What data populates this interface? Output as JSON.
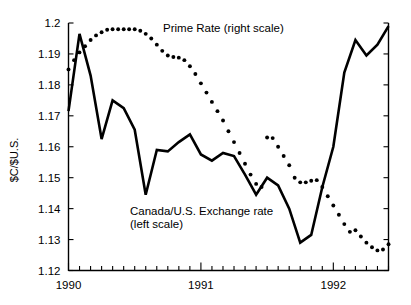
{
  "chart_data": {
    "type": "line",
    "title": "",
    "xlabel": "",
    "ylabel": "$C/$U.S.",
    "ylim": [
      1.12,
      1.2
    ],
    "yticks": [
      "1.12",
      "1.13",
      "1.14",
      "1.15",
      "1.16",
      "1.17",
      "1.18",
      "1.19",
      "1.2"
    ],
    "ytick_values": [
      1.12,
      1.13,
      1.14,
      1.15,
      1.16,
      1.17,
      1.18,
      1.19,
      1.2
    ],
    "xticks": [
      "1990",
      "1991",
      "1992"
    ],
    "xtick_values": [
      1990.0,
      1991.0,
      1992.0
    ],
    "xlim": [
      1990.0,
      1992.4167
    ],
    "x_minor_tick_interval_months": 1,
    "grid": false,
    "right_axis": {
      "label": "Prime Rate (right scale)",
      "ticks_shown": true,
      "tick_labels_shown": false,
      "n_ticks": 9
    },
    "legend_position": "inline-annotations",
    "annotations": [
      {
        "name": "prime-rate-annotation",
        "text": "Prime Rate (right scale)",
        "x_px": 163,
        "y_px": 32
      },
      {
        "name": "exchange-rate-annotation-line1",
        "text": "Canada/U.S. Exchange rate",
        "x_px": 130,
        "y_px": 215
      },
      {
        "name": "exchange-rate-annotation-line2",
        "text": "(left scale)",
        "x_px": 130,
        "y_px": 228
      }
    ],
    "series": [
      {
        "name": "Canada/U.S. Exchange rate (left scale)",
        "short_name": "exchange-rate",
        "style": "solid",
        "scale": "left",
        "color": "#000000",
        "x": [
          1990.0,
          1990.083,
          1990.167,
          1990.25,
          1990.333,
          1990.417,
          1990.5,
          1990.583,
          1990.667,
          1990.75,
          1990.833,
          1990.917,
          1991.0,
          1991.083,
          1991.167,
          1991.25,
          1991.333,
          1991.417,
          1991.5,
          1991.583,
          1991.667,
          1991.75,
          1991.833,
          1991.917,
          1992.0,
          1992.083,
          1992.167,
          1992.25,
          1992.333,
          1992.417
        ],
        "values": [
          1.1715,
          1.1965,
          1.183,
          1.1625,
          1.175,
          1.1725,
          1.1655,
          1.1445,
          1.159,
          1.1585,
          1.1615,
          1.164,
          1.1575,
          1.1555,
          1.158,
          1.157,
          1.151,
          1.1445,
          1.15,
          1.1475,
          1.14,
          1.129,
          1.1315,
          1.147,
          1.16,
          1.184,
          1.1945,
          1.1895,
          1.193,
          1.199
        ]
      },
      {
        "name": "Prime Rate (right scale)",
        "short_name": "prime-rate",
        "style": "dotted",
        "scale": "right",
        "color": "#000000",
        "x": [
          1990.0,
          1990.042,
          1990.083,
          1990.125,
          1990.167,
          1990.208,
          1990.25,
          1990.292,
          1990.333,
          1990.375,
          1990.417,
          1990.458,
          1990.5,
          1990.542,
          1990.583,
          1990.625,
          1990.667,
          1990.708,
          1990.75,
          1990.792,
          1990.833,
          1990.875,
          1990.917,
          1990.958,
          1991.0,
          1991.042,
          1991.083,
          1991.125,
          1991.167,
          1991.208,
          1991.25,
          1991.292,
          1991.333,
          1991.375,
          1991.417,
          1991.458,
          1991.5,
          1991.542,
          1991.583,
          1991.625,
          1991.667,
          1991.708,
          1991.75,
          1991.792,
          1991.833,
          1991.875,
          1991.917,
          1991.958,
          1992.0,
          1992.042,
          1992.083,
          1992.125,
          1992.167,
          1992.208,
          1992.25,
          1992.292,
          1992.333,
          1992.375,
          1992.417
        ],
        "values_equiv_left_axis": [
          1.185,
          1.188,
          1.1905,
          1.1925,
          1.1945,
          1.196,
          1.197,
          1.1978,
          1.198,
          1.198,
          1.198,
          1.198,
          1.198,
          1.1975,
          1.1965,
          1.195,
          1.193,
          1.191,
          1.1895,
          1.189,
          1.1888,
          1.188,
          1.186,
          1.1835,
          1.1805,
          1.1775,
          1.1745,
          1.1715,
          1.1685,
          1.165,
          1.1615,
          1.158,
          1.1545,
          1.151,
          1.148,
          1.147,
          1.163,
          1.1628,
          1.16,
          1.157,
          1.154,
          1.15,
          1.1485,
          1.1485,
          1.149,
          1.1492,
          1.147,
          1.144,
          1.141,
          1.138,
          1.135,
          1.1325,
          1.133,
          1.131,
          1.129,
          1.1275,
          1.1265,
          1.1268,
          1.1285
        ]
      }
    ]
  },
  "axes": {
    "y_axis_title": "$C/$U.S."
  }
}
